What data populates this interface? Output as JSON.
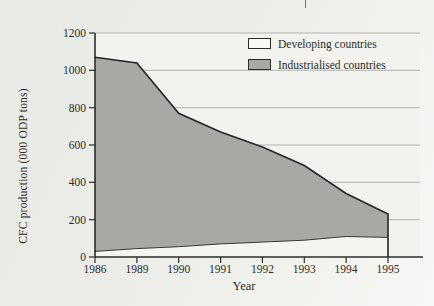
{
  "chart_data": {
    "type": "area",
    "stacked": true,
    "categories": [
      "1986",
      "1989",
      "1990",
      "1991",
      "1992",
      "1993",
      "1994",
      "1995"
    ],
    "series": [
      {
        "name": "Developing countries",
        "color": "#f4f5f1",
        "values": [
          30,
          45,
          55,
          70,
          80,
          90,
          110,
          105
        ]
      },
      {
        "name": "Industrialised countries",
        "color": "#a8a9a5",
        "values": [
          1040,
          995,
          715,
          600,
          510,
          400,
          230,
          125
        ]
      }
    ],
    "stacked_totals": [
      1070,
      1040,
      770,
      670,
      590,
      490,
      340,
      230
    ],
    "xlabel": "Year",
    "ylabel": "CFC production (000 ODP tons)",
    "ylim": [
      0,
      1200
    ],
    "yticks": [
      0,
      200,
      400,
      600,
      800,
      1000,
      1200
    ],
    "grid": "horizontal",
    "legend_position": "top-right-inside"
  },
  "colors": {
    "page_bg_from": "#e8eae5",
    "page_bg_to": "#f7f8f5",
    "plot_bg": "#f2f3ee",
    "grid_line": "#b1b4ae",
    "axis_line": "#2c2c28",
    "total_outline": "#26262a",
    "series_divider": "#3a3a34",
    "text": "#2b2b27",
    "legend_swatch_developing": "#f7f8f4",
    "legend_swatch_industrialised": "#a8a9a5",
    "artifact_line": "#73736f"
  }
}
